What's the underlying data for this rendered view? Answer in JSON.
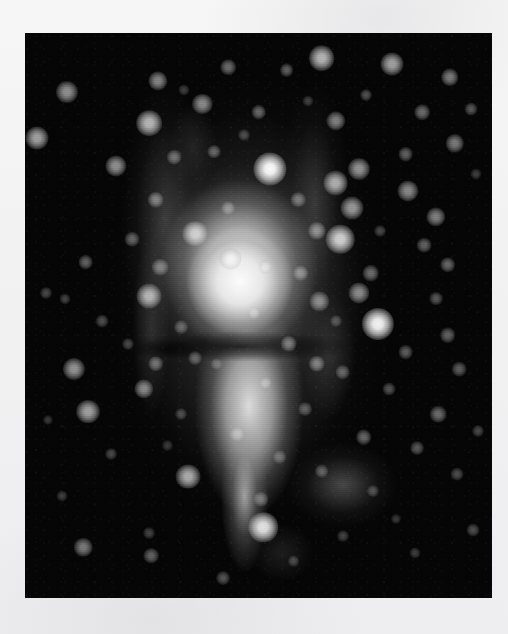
{
  "page": {
    "background_color": "#f3f3f3",
    "width": 508,
    "height": 634
  },
  "figure": {
    "name": "astronomical-image",
    "kind": "grayscale astronomical photograph",
    "caption": "",
    "frame": {
      "x": 25,
      "y": 33,
      "width": 467,
      "height": 565,
      "background_color": "#050505",
      "border_color": "#000000"
    },
    "palette": {
      "sky": "#050505",
      "nebula_core": "#fcfcfc",
      "nebula_mid": "#c8c8c8",
      "nebula_faint": "#5a5a5a",
      "star": "#ffffff",
      "page": "#f3f3f3"
    },
    "nebula": {
      "core_center_pct": [
        46,
        44
      ],
      "upper_lobe_center_pct": [
        46,
        41
      ],
      "lower_lobe_center_pct": [
        48,
        66
      ],
      "dust_lane_center_pct": [
        46,
        55.5
      ],
      "shape": "hourglass / bowtie with dark equatorial lane"
    },
    "stars": [
      {
        "x": 9.0,
        "y": 10.5,
        "r": 4.8,
        "b": 0.55
      },
      {
        "x": 28.5,
        "y": 8.5,
        "r": 4.2,
        "b": 0.5
      },
      {
        "x": 43.5,
        "y": 6.0,
        "r": 3.4,
        "b": 0.4
      },
      {
        "x": 56.0,
        "y": 6.5,
        "r": 3.0,
        "b": 0.35
      },
      {
        "x": 63.5,
        "y": 4.5,
        "r": 5.6,
        "b": 0.7
      },
      {
        "x": 78.5,
        "y": 5.5,
        "r": 5.0,
        "b": 0.62
      },
      {
        "x": 91.0,
        "y": 7.8,
        "r": 3.8,
        "b": 0.46
      },
      {
        "x": 73.0,
        "y": 11.0,
        "r": 2.6,
        "b": 0.3
      },
      {
        "x": 38.0,
        "y": 12.5,
        "r": 4.4,
        "b": 0.52
      },
      {
        "x": 2.5,
        "y": 18.5,
        "r": 5.0,
        "b": 0.62
      },
      {
        "x": 26.5,
        "y": 16.0,
        "r": 5.6,
        "b": 0.7
      },
      {
        "x": 50.0,
        "y": 14.0,
        "r": 3.2,
        "b": 0.38
      },
      {
        "x": 66.5,
        "y": 15.5,
        "r": 4.2,
        "b": 0.48
      },
      {
        "x": 85.0,
        "y": 14.0,
        "r": 3.4,
        "b": 0.4
      },
      {
        "x": 95.5,
        "y": 13.5,
        "r": 2.8,
        "b": 0.32
      },
      {
        "x": 19.5,
        "y": 23.5,
        "r": 4.6,
        "b": 0.55
      },
      {
        "x": 32.0,
        "y": 22.0,
        "r": 3.2,
        "b": 0.38
      },
      {
        "x": 40.5,
        "y": 21.0,
        "r": 3.0,
        "b": 0.35
      },
      {
        "x": 52.5,
        "y": 24.0,
        "r": 7.2,
        "b": 0.98
      },
      {
        "x": 71.5,
        "y": 24.0,
        "r": 4.8,
        "b": 0.56
      },
      {
        "x": 81.5,
        "y": 21.5,
        "r": 3.2,
        "b": 0.36
      },
      {
        "x": 92.0,
        "y": 19.5,
        "r": 4.0,
        "b": 0.46
      },
      {
        "x": 66.5,
        "y": 26.5,
        "r": 5.4,
        "b": 0.66
      },
      {
        "x": 82.0,
        "y": 28.0,
        "r": 4.6,
        "b": 0.52
      },
      {
        "x": 28.0,
        "y": 29.5,
        "r": 3.6,
        "b": 0.42
      },
      {
        "x": 43.5,
        "y": 31.0,
        "r": 3.0,
        "b": 0.34
      },
      {
        "x": 58.5,
        "y": 29.5,
        "r": 3.4,
        "b": 0.38
      },
      {
        "x": 70.0,
        "y": 31.0,
        "r": 5.0,
        "b": 0.58
      },
      {
        "x": 88.0,
        "y": 32.5,
        "r": 4.2,
        "b": 0.48
      },
      {
        "x": 23.0,
        "y": 36.5,
        "r": 3.2,
        "b": 0.36
      },
      {
        "x": 36.5,
        "y": 35.5,
        "r": 5.6,
        "b": 0.7
      },
      {
        "x": 62.5,
        "y": 35.0,
        "r": 4.0,
        "b": 0.46
      },
      {
        "x": 67.5,
        "y": 36.5,
        "r": 6.2,
        "b": 0.8
      },
      {
        "x": 85.5,
        "y": 37.5,
        "r": 3.2,
        "b": 0.36
      },
      {
        "x": 13.0,
        "y": 40.5,
        "r": 3.2,
        "b": 0.36
      },
      {
        "x": 29.0,
        "y": 41.5,
        "r": 3.6,
        "b": 0.4
      },
      {
        "x": 44.0,
        "y": 40.0,
        "r": 4.6,
        "b": 0.54
      },
      {
        "x": 51.5,
        "y": 41.5,
        "r": 3.0,
        "b": 0.34
      },
      {
        "x": 59.0,
        "y": 42.5,
        "r": 3.4,
        "b": 0.38
      },
      {
        "x": 74.0,
        "y": 42.5,
        "r": 3.6,
        "b": 0.4
      },
      {
        "x": 90.5,
        "y": 41.0,
        "r": 3.4,
        "b": 0.38
      },
      {
        "x": 4.5,
        "y": 46.0,
        "r": 2.6,
        "b": 0.26
      },
      {
        "x": 8.5,
        "y": 47.0,
        "r": 2.4,
        "b": 0.24
      },
      {
        "x": 26.5,
        "y": 46.5,
        "r": 5.4,
        "b": 0.66
      },
      {
        "x": 63.0,
        "y": 47.5,
        "r": 4.2,
        "b": 0.48
      },
      {
        "x": 71.5,
        "y": 46.0,
        "r": 4.6,
        "b": 0.52
      },
      {
        "x": 88.0,
        "y": 47.0,
        "r": 3.0,
        "b": 0.32
      },
      {
        "x": 16.5,
        "y": 51.0,
        "r": 2.8,
        "b": 0.28
      },
      {
        "x": 33.5,
        "y": 52.0,
        "r": 3.0,
        "b": 0.32
      },
      {
        "x": 75.5,
        "y": 51.5,
        "r": 7.0,
        "b": 0.95
      },
      {
        "x": 90.5,
        "y": 53.5,
        "r": 3.4,
        "b": 0.36
      },
      {
        "x": 22.0,
        "y": 55.0,
        "r": 2.6,
        "b": 0.26
      },
      {
        "x": 56.5,
        "y": 55.0,
        "r": 3.6,
        "b": 0.42
      },
      {
        "x": 81.5,
        "y": 56.5,
        "r": 3.2,
        "b": 0.34
      },
      {
        "x": 10.5,
        "y": 59.5,
        "r": 4.8,
        "b": 0.56
      },
      {
        "x": 28.0,
        "y": 58.5,
        "r": 3.4,
        "b": 0.38
      },
      {
        "x": 36.5,
        "y": 57.5,
        "r": 3.0,
        "b": 0.32
      },
      {
        "x": 62.5,
        "y": 58.5,
        "r": 3.6,
        "b": 0.42
      },
      {
        "x": 68.0,
        "y": 60.0,
        "r": 3.2,
        "b": 0.34
      },
      {
        "x": 93.0,
        "y": 59.5,
        "r": 3.2,
        "b": 0.34
      },
      {
        "x": 25.5,
        "y": 63.0,
        "r": 4.2,
        "b": 0.5
      },
      {
        "x": 51.5,
        "y": 62.0,
        "r": 2.8,
        "b": 0.3
      },
      {
        "x": 78.0,
        "y": 63.0,
        "r": 2.8,
        "b": 0.3
      },
      {
        "x": 13.5,
        "y": 67.0,
        "r": 5.2,
        "b": 0.62
      },
      {
        "x": 33.5,
        "y": 67.5,
        "r": 2.6,
        "b": 0.26
      },
      {
        "x": 60.0,
        "y": 66.5,
        "r": 3.0,
        "b": 0.32
      },
      {
        "x": 88.5,
        "y": 67.5,
        "r": 3.6,
        "b": 0.4
      },
      {
        "x": 45.5,
        "y": 71.0,
        "r": 3.2,
        "b": 0.34
      },
      {
        "x": 72.5,
        "y": 71.5,
        "r": 3.4,
        "b": 0.38
      },
      {
        "x": 18.5,
        "y": 74.5,
        "r": 2.6,
        "b": 0.26
      },
      {
        "x": 54.5,
        "y": 75.0,
        "r": 3.0,
        "b": 0.3
      },
      {
        "x": 84.0,
        "y": 73.5,
        "r": 3.0,
        "b": 0.32
      },
      {
        "x": 35.0,
        "y": 78.5,
        "r": 5.4,
        "b": 0.66
      },
      {
        "x": 63.5,
        "y": 77.5,
        "r": 3.0,
        "b": 0.3
      },
      {
        "x": 92.5,
        "y": 78.0,
        "r": 2.8,
        "b": 0.28
      },
      {
        "x": 8.0,
        "y": 82.0,
        "r": 2.4,
        "b": 0.22
      },
      {
        "x": 50.5,
        "y": 82.5,
        "r": 3.2,
        "b": 0.34
      },
      {
        "x": 74.5,
        "y": 81.0,
        "r": 2.6,
        "b": 0.26
      },
      {
        "x": 51.0,
        "y": 87.5,
        "r": 6.4,
        "b": 0.88
      },
      {
        "x": 26.5,
        "y": 88.5,
        "r": 2.6,
        "b": 0.24
      },
      {
        "x": 68.0,
        "y": 89.0,
        "r": 2.6,
        "b": 0.24
      },
      {
        "x": 12.5,
        "y": 91.0,
        "r": 4.0,
        "b": 0.46
      },
      {
        "x": 27.0,
        "y": 92.5,
        "r": 3.4,
        "b": 0.36
      },
      {
        "x": 57.5,
        "y": 93.5,
        "r": 2.6,
        "b": 0.24
      },
      {
        "x": 83.5,
        "y": 92.0,
        "r": 2.4,
        "b": 0.22
      },
      {
        "x": 42.5,
        "y": 96.5,
        "r": 3.0,
        "b": 0.3
      },
      {
        "x": 96.0,
        "y": 88.0,
        "r": 2.8,
        "b": 0.28
      },
      {
        "x": 97.0,
        "y": 70.5,
        "r": 2.6,
        "b": 0.26
      },
      {
        "x": 96.5,
        "y": 25.0,
        "r": 2.4,
        "b": 0.22
      },
      {
        "x": 5.0,
        "y": 68.5,
        "r": 2.2,
        "b": 0.2
      },
      {
        "x": 47.0,
        "y": 18.0,
        "r": 2.6,
        "b": 0.26
      },
      {
        "x": 34.0,
        "y": 10.0,
        "r": 2.4,
        "b": 0.22
      },
      {
        "x": 60.5,
        "y": 12.0,
        "r": 2.4,
        "b": 0.22
      },
      {
        "x": 76.0,
        "y": 35.0,
        "r": 2.6,
        "b": 0.26
      },
      {
        "x": 49.0,
        "y": 49.5,
        "r": 2.8,
        "b": 0.3
      },
      {
        "x": 41.0,
        "y": 58.5,
        "r": 2.4,
        "b": 0.24
      },
      {
        "x": 66.5,
        "y": 51.0,
        "r": 2.6,
        "b": 0.26
      },
      {
        "x": 30.5,
        "y": 73.0,
        "r": 2.2,
        "b": 0.2
      },
      {
        "x": 79.5,
        "y": 86.0,
        "r": 2.2,
        "b": 0.2
      }
    ]
  }
}
